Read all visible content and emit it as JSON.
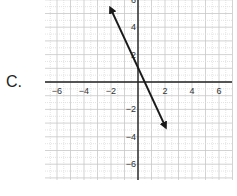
{
  "option_label": "C.",
  "chart_data": {
    "type": "line",
    "title": "",
    "xlabel": "",
    "ylabel": "",
    "xlim": [
      -7,
      7
    ],
    "ylim": [
      -7,
      6
    ],
    "grid": true,
    "x_ticks": [
      -6,
      -4,
      -2,
      2,
      4,
      6
    ],
    "y_ticks": [
      6,
      4,
      2,
      -2,
      -4,
      -6
    ],
    "x_tick_labels": [
      "−6",
      "−4",
      "−2",
      "2",
      "4",
      "6"
    ],
    "y_tick_labels": [
      "6",
      "4",
      "2",
      "−2",
      "−4",
      "−6"
    ],
    "series": [
      {
        "name": "line",
        "equation": "y = -2x + 1",
        "x": [
          -2,
          2
        ],
        "y": [
          5.3,
          -3.2
        ],
        "arrows": "both",
        "color": "#1a1a1a"
      }
    ]
  }
}
